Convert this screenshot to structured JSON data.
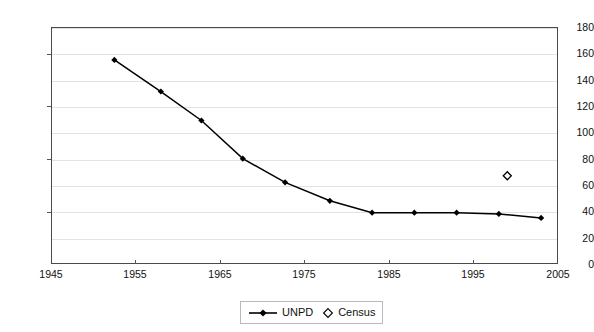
{
  "chart_data": {
    "type": "line",
    "title": "",
    "subtitle": "",
    "xlabel": "",
    "ylabel": "",
    "xlim": [
      1945,
      2005
    ],
    "ylim": [
      0,
      180
    ],
    "xticks": [
      1945,
      1955,
      1965,
      1975,
      1985,
      1995,
      2005
    ],
    "yticks": [
      0,
      20,
      40,
      60,
      80,
      100,
      120,
      140,
      160,
      180
    ],
    "grid": "horizontal",
    "legend_position": "bottom-center",
    "series": [
      {
        "name": "UNPD",
        "marker": "filled-diamond",
        "line": "solid",
        "color": "#000000",
        "x": [
          1952.5,
          1958.0,
          1962.8,
          1967.7,
          1972.7,
          1978.0,
          1983.0,
          1988.0,
          1993.0,
          1998.0,
          2003.0
        ],
        "values": [
          155,
          131,
          109,
          80,
          62,
          48,
          39,
          39,
          39,
          38,
          35
        ]
      },
      {
        "name": "Census",
        "marker": "open-diamond",
        "line": "none",
        "color": "#000000",
        "x": [
          1999.0
        ],
        "values": [
          67
        ]
      }
    ]
  },
  "axes": {
    "y_tick_labels": [
      "180",
      "160",
      "140",
      "120",
      "100",
      "80",
      "60",
      "40",
      "20",
      "0"
    ],
    "x_tick_labels": [
      "1945",
      "1955",
      "1965",
      "1975",
      "1985",
      "1995",
      "2005"
    ]
  },
  "legend": {
    "items": [
      {
        "label": "UNPD",
        "marker": "line-with-filled-diamond"
      },
      {
        "label": "Census",
        "marker": "open-diamond"
      }
    ]
  },
  "colors": {
    "series": "#000000",
    "gridline": "#e3e3e6",
    "axis": "#4a4a4a",
    "text": "#111111",
    "background": "#ffffff"
  }
}
